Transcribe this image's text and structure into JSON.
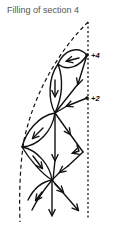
{
  "title": "Filling of section 4",
  "labels": {
    "node_upper": "+4",
    "node_lower": "+2"
  },
  "diagram": {
    "nodes": [
      {
        "id": "plus4",
        "label": "+4",
        "x": 87,
        "y": 55
      },
      {
        "id": "plus2",
        "label": "+2",
        "x": 87,
        "y": 98
      },
      {
        "id": "upper-left",
        "x": 62,
        "y": 62
      },
      {
        "id": "middle",
        "x": 55,
        "y": 113
      },
      {
        "id": "lower-left",
        "x": 22,
        "y": 147
      },
      {
        "id": "right-vertex",
        "x": 83,
        "y": 152
      },
      {
        "id": "bottom",
        "x": 52,
        "y": 180
      }
    ],
    "colors": {
      "ink": "#111111",
      "title": "#555555",
      "background": "#ffffff"
    }
  }
}
